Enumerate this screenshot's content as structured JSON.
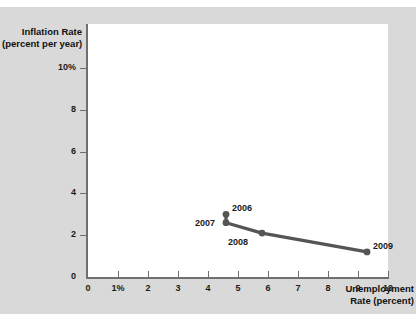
{
  "chart_data": {
    "type": "scatter",
    "title": "",
    "subtitle": "",
    "xlabel": "Unemployment Rate (percent)",
    "ylabel": "Inflation Rate (percent per year)",
    "xlim": [
      0,
      10.4
    ],
    "ylim": [
      0,
      11.2
    ],
    "grid": false,
    "legend": "none",
    "connected": true,
    "xticks": [
      {
        "value": 0,
        "label": "0"
      },
      {
        "value": 1,
        "label": "1%"
      },
      {
        "value": 2,
        "label": "2"
      },
      {
        "value": 3,
        "label": "3"
      },
      {
        "value": 4,
        "label": "4"
      },
      {
        "value": 5,
        "label": "5"
      },
      {
        "value": 6,
        "label": "6"
      },
      {
        "value": 7,
        "label": "7"
      },
      {
        "value": 8,
        "label": "8"
      },
      {
        "value": 9,
        "label": "9"
      },
      {
        "value": 10,
        "label": "10"
      }
    ],
    "yticks": [
      {
        "value": 0,
        "label": "0"
      },
      {
        "value": 2,
        "label": "2"
      },
      {
        "value": 4,
        "label": "4"
      },
      {
        "value": 6,
        "label": "6"
      },
      {
        "value": 8,
        "label": "8"
      },
      {
        "value": 10,
        "label": "10%"
      }
    ],
    "series": [
      {
        "name": "Phillips curve points",
        "color": "#555555",
        "marker": "filled-circle",
        "points": [
          {
            "label": "2006",
            "x": 4.6,
            "y": 3.0,
            "label_pos": "right"
          },
          {
            "label": "2007",
            "x": 4.6,
            "y": 2.6,
            "label_pos": "left"
          },
          {
            "label": "2008",
            "x": 5.8,
            "y": 2.1,
            "label_pos": "below-left"
          },
          {
            "label": "2009",
            "x": 9.3,
            "y": 1.2,
            "label_pos": "right"
          }
        ]
      }
    ]
  },
  "axis_titles": {
    "y_line1": "Inflation Rate",
    "y_line2": "(percent per year)",
    "x_line1": "Unemployment",
    "x_line2": "Rate (percent)"
  },
  "colors": {
    "backdrop": "#d9d9d9",
    "plot_background": "#ffffff",
    "axis": "#6f6f6f",
    "series": "#555555",
    "text": "#111111"
  }
}
